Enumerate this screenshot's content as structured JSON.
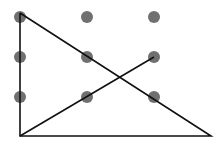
{
  "diagram": {
    "title": "",
    "dot_color": "#707070",
    "line_color": "#111111",
    "dots": [
      {
        "x": 20,
        "y": 17
      },
      {
        "x": 87,
        "y": 17
      },
      {
        "x": 154,
        "y": 17
      },
      {
        "x": 20,
        "y": 57
      },
      {
        "x": 87,
        "y": 57
      },
      {
        "x": 154,
        "y": 57
      },
      {
        "x": 20,
        "y": 97
      },
      {
        "x": 87,
        "y": 97
      },
      {
        "x": 154,
        "y": 97
      }
    ],
    "path": [
      [
        20,
        13
      ],
      [
        20,
        136
      ],
      [
        211,
        136
      ],
      [
        20,
        13
      ]
    ],
    "extra_line": [
      [
        20,
        136
      ],
      [
        154,
        57
      ]
    ]
  }
}
